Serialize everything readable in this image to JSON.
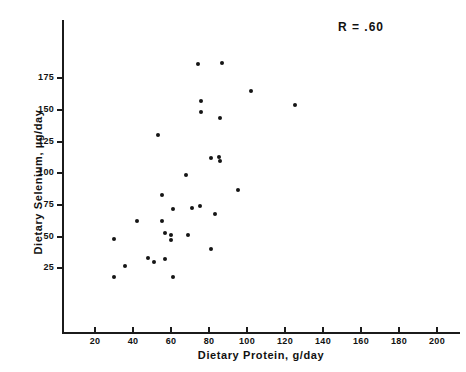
{
  "chart_data": {
    "type": "scatter",
    "title": "",
    "xlabel": "Dietary Protein, g/day",
    "ylabel": "Dietary Selenium, µg/day",
    "annotation": "R = .60",
    "correlation": 0.6,
    "xlim": [
      0,
      210
    ],
    "ylim": [
      0,
      200
    ],
    "xticks": [
      20,
      40,
      60,
      80,
      100,
      120,
      140,
      160,
      180,
      200
    ],
    "yticks": [
      25,
      50,
      75,
      100,
      125,
      150,
      175
    ],
    "xtick_labels": [
      "20",
      "40",
      "60",
      "80",
      "100",
      "120",
      "140",
      "160",
      "180",
      "200"
    ],
    "ytick_labels": [
      "25",
      "50",
      "75",
      "100",
      "125",
      "150",
      "175"
    ],
    "grid": false,
    "legend": null,
    "marker": "filled-circle",
    "marker_color": "#151515",
    "points": [
      {
        "x": 74,
        "y": 186
      },
      {
        "x": 87,
        "y": 187
      },
      {
        "x": 102,
        "y": 165
      },
      {
        "x": 76,
        "y": 157
      },
      {
        "x": 125,
        "y": 154
      },
      {
        "x": 76,
        "y": 148
      },
      {
        "x": 86,
        "y": 144
      },
      {
        "x": 53,
        "y": 130
      },
      {
        "x": 81,
        "y": 112
      },
      {
        "x": 85,
        "y": 113
      },
      {
        "x": 86,
        "y": 110
      },
      {
        "x": 68,
        "y": 99
      },
      {
        "x": 95,
        "y": 87
      },
      {
        "x": 55,
        "y": 83
      },
      {
        "x": 61,
        "y": 72
      },
      {
        "x": 71,
        "y": 73
      },
      {
        "x": 75,
        "y": 74
      },
      {
        "x": 83,
        "y": 68
      },
      {
        "x": 42,
        "y": 62
      },
      {
        "x": 55,
        "y": 62
      },
      {
        "x": 57,
        "y": 53
      },
      {
        "x": 60,
        "y": 51
      },
      {
        "x": 69,
        "y": 51
      },
      {
        "x": 60,
        "y": 47
      },
      {
        "x": 30,
        "y": 48
      },
      {
        "x": 81,
        "y": 40
      },
      {
        "x": 48,
        "y": 33
      },
      {
        "x": 51,
        "y": 30
      },
      {
        "x": 57,
        "y": 32
      },
      {
        "x": 36,
        "y": 27
      },
      {
        "x": 30,
        "y": 18
      },
      {
        "x": 61,
        "y": 18
      }
    ]
  }
}
